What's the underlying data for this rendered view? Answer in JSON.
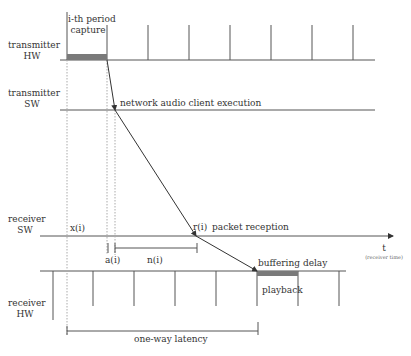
{
  "rows": {
    "transmitter_hw": "transmitter\nHW",
    "transmitter_hw_l1": "transmitter",
    "transmitter_hw_l2": "HW",
    "transmitter_sw_l1": "transmitter",
    "transmitter_sw_l2": "SW",
    "receiver_sw_l1": "receiver",
    "receiver_sw_l2": "SW",
    "receiver_hw_l1": "receiver",
    "receiver_hw_l2": "HW"
  },
  "annotations": {
    "capture_l1": "i-th period",
    "capture_l2": "capture",
    "client_execution": "network audio client execution",
    "packet_reception": "packet reception",
    "x_i": "x(i)",
    "r_i": "r(i)",
    "a_i": "a(i)",
    "n_i": "n(i)",
    "buffering_delay": "buffering delay",
    "playback": "playback",
    "one_way_latency": "one-way latency",
    "time_axis": "t",
    "time_axis_sub": "(receiver time)"
  },
  "colors": {
    "line": "#555555",
    "bar": "#7a7a7a",
    "dotted": "#aaaaaa"
  }
}
